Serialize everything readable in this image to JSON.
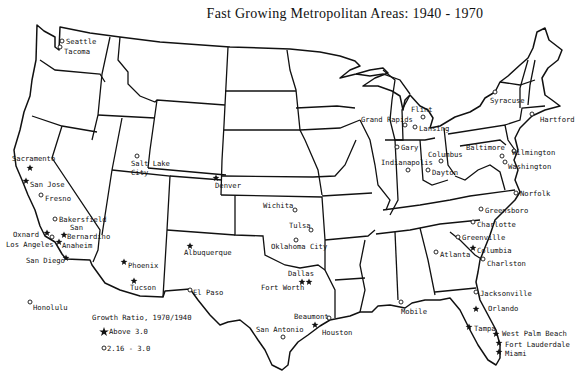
{
  "title": "Fast Growing Metropolitan Areas: 1940 - 1970",
  "legend": {
    "title": "Growth Ratio, 1970/1940",
    "items": [
      {
        "symbol": "star",
        "label": "Above 3.0"
      },
      {
        "symbol": "circle",
        "label": "2.16 - 3.0"
      }
    ]
  },
  "cities": [
    {
      "name": "Seattle",
      "symbol": "circle",
      "x": 62,
      "y": 41,
      "lx": 66,
      "ly": 44
    },
    {
      "name": "Tacoma",
      "symbol": "circle",
      "x": 60,
      "y": 47,
      "lx": 64,
      "ly": 54
    },
    {
      "name": "Sacramento",
      "symbol": "star",
      "x": 30,
      "y": 168,
      "lx": 12,
      "ly": 161
    },
    {
      "name": "San Jose",
      "symbol": "star",
      "x": 26,
      "y": 181,
      "lx": 30,
      "ly": 187
    },
    {
      "name": "Fresno",
      "symbol": "circle",
      "x": 41,
      "y": 195,
      "lx": 45,
      "ly": 201
    },
    {
      "name": "Bakersfield",
      "symbol": "circle",
      "x": 55,
      "y": 219,
      "lx": 59,
      "ly": 222
    },
    {
      "name": "San",
      "symbol": "none",
      "x": 0,
      "y": 0,
      "lx": 70,
      "ly": 230
    },
    {
      "name": "Bernardino",
      "symbol": "star",
      "x": 64,
      "y": 235,
      "lx": 67,
      "ly": 239
    },
    {
      "name": "Oxnard",
      "symbol": "star",
      "x": 47,
      "y": 233,
      "lx": 13,
      "ly": 237
    },
    {
      "name": "Los Angeles",
      "symbol": "circle",
      "x": 52,
      "y": 237,
      "lx": 6,
      "ly": 247
    },
    {
      "name": "Anaheim",
      "symbol": "star",
      "x": 59,
      "y": 242,
      "lx": 62,
      "ly": 248
    },
    {
      "name": "San Diego",
      "symbol": "star",
      "x": 66,
      "y": 258,
      "lx": 26,
      "ly": 263
    },
    {
      "name": "Salt Lake City",
      "symbol": "circle",
      "x": 137,
      "y": 156,
      "lx": 131,
      "ly": 166,
      "lines": [
        "Salt Lake",
        "City"
      ]
    },
    {
      "name": "Denver",
      "symbol": "star",
      "x": 216,
      "y": 178,
      "lx": 215,
      "ly": 188
    },
    {
      "name": "Phoenix",
      "symbol": "star",
      "x": 124,
      "y": 262,
      "lx": 128,
      "ly": 268
    },
    {
      "name": "Tucson",
      "symbol": "star",
      "x": 134,
      "y": 281,
      "lx": 130,
      "ly": 290
    },
    {
      "name": "Albuquerque",
      "symbol": "star",
      "x": 190,
      "y": 246,
      "lx": 184,
      "ly": 255
    },
    {
      "name": "El Paso",
      "symbol": "circle",
      "x": 190,
      "y": 290,
      "lx": 193,
      "ly": 295
    },
    {
      "name": "Wichita",
      "symbol": "circle",
      "x": 295,
      "y": 210,
      "lx": 263,
      "ly": 208
    },
    {
      "name": "Tulsa",
      "symbol": "circle",
      "x": 311,
      "y": 230,
      "lx": 289,
      "ly": 228
    },
    {
      "name": "Oklahoma City",
      "symbol": "circle",
      "x": 296,
      "y": 240,
      "lx": 271,
      "ly": 249
    },
    {
      "name": "Dallas",
      "symbol": "star",
      "x": 309,
      "y": 282,
      "lx": 288,
      "ly": 276
    },
    {
      "name": "Fort Worth",
      "symbol": "star",
      "x": 302,
      "y": 282,
      "lx": 261,
      "ly": 290
    },
    {
      "name": "Beaumont",
      "symbol": "circle",
      "x": 329,
      "y": 318,
      "lx": 294,
      "ly": 319
    },
    {
      "name": "Houston",
      "symbol": "star",
      "x": 315,
      "y": 325,
      "lx": 322,
      "ly": 335
    },
    {
      "name": "San Antonio",
      "symbol": "circle",
      "x": 283,
      "y": 337,
      "lx": 256,
      "ly": 332
    },
    {
      "name": "Honolulu",
      "symbol": "circle",
      "x": 30,
      "y": 302,
      "lx": 33,
      "ly": 310
    },
    {
      "name": "Grand Rapids",
      "symbol": "circle",
      "x": 405,
      "y": 125,
      "lx": 361,
      "ly": 122
    },
    {
      "name": "Flint",
      "symbol": "circle",
      "x": 423,
      "y": 117,
      "lx": 411,
      "ly": 112
    },
    {
      "name": "Lansing",
      "symbol": "circle",
      "x": 415,
      "y": 127,
      "lx": 419,
      "ly": 131
    },
    {
      "name": "Gary",
      "symbol": "circle",
      "x": 397,
      "y": 147,
      "lx": 401,
      "ly": 150
    },
    {
      "name": "Indianapolis",
      "symbol": "circle",
      "x": 408,
      "y": 170,
      "lx": 381,
      "ly": 165
    },
    {
      "name": "Columbus",
      "symbol": "circle",
      "x": 441,
      "y": 161,
      "lx": 428,
      "ly": 157
    },
    {
      "name": "Dayton",
      "symbol": "circle",
      "x": 428,
      "y": 170,
      "lx": 432,
      "ly": 175
    },
    {
      "name": "Syracuse",
      "symbol": "circle",
      "x": 495,
      "y": 92,
      "lx": 490,
      "ly": 103
    },
    {
      "name": "Hartford",
      "symbol": "circle",
      "x": 532,
      "y": 114,
      "lx": 540,
      "ly": 122
    },
    {
      "name": "Baltimore",
      "symbol": "circle",
      "x": 502,
      "y": 156,
      "lx": 466,
      "ly": 150
    },
    {
      "name": "Wilmington",
      "symbol": "circle",
      "x": 514,
      "y": 151,
      "lx": 512,
      "ly": 155
    },
    {
      "name": "Washington",
      "symbol": "circle",
      "x": 505,
      "y": 162,
      "lx": 508,
      "ly": 169
    },
    {
      "name": "Norfolk",
      "symbol": "circle",
      "x": 516,
      "y": 193,
      "lx": 520,
      "ly": 196
    },
    {
      "name": "Greensboro",
      "symbol": "circle",
      "x": 481,
      "y": 209,
      "lx": 485,
      "ly": 213
    },
    {
      "name": "Charlotte",
      "symbol": "circle",
      "x": 473,
      "y": 222,
      "lx": 477,
      "ly": 227
    },
    {
      "name": "Greenville",
      "symbol": "circle",
      "x": 458,
      "y": 237,
      "lx": 462,
      "ly": 240
    },
    {
      "name": "Columbia",
      "symbol": "star",
      "x": 473,
      "y": 248,
      "lx": 477,
      "ly": 253
    },
    {
      "name": "Atlanta",
      "symbol": "circle",
      "x": 436,
      "y": 252,
      "lx": 440,
      "ly": 257
    },
    {
      "name": "Charlston",
      "symbol": "circle",
      "x": 483,
      "y": 259,
      "lx": 487,
      "ly": 266
    },
    {
      "name": "Jacksonville",
      "symbol": "circle",
      "x": 476,
      "y": 292,
      "lx": 480,
      "ly": 296
    },
    {
      "name": "Mobile",
      "symbol": "circle",
      "x": 401,
      "y": 302,
      "lx": 401,
      "ly": 314
    },
    {
      "name": "Orlando",
      "symbol": "star",
      "x": 476,
      "y": 309,
      "lx": 488,
      "ly": 311
    },
    {
      "name": "Tampa",
      "symbol": "star",
      "x": 469,
      "y": 327,
      "lx": 474,
      "ly": 331
    },
    {
      "name": "West Palm Beach",
      "symbol": "star",
      "x": 496,
      "y": 334,
      "lx": 502,
      "ly": 336
    },
    {
      "name": "Fort Lauderdale",
      "symbol": "star",
      "x": 499,
      "y": 343,
      "lx": 505,
      "ly": 347
    },
    {
      "name": "Miami",
      "symbol": "star",
      "x": 499,
      "y": 352,
      "lx": 505,
      "ly": 356
    }
  ]
}
